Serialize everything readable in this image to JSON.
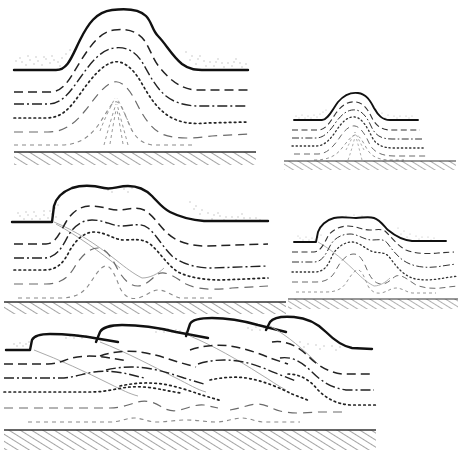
{
  "figure": {
    "background_color": "#ffffff",
    "width": 459,
    "height": 461,
    "ink_color": "#1a1a1a",
    "fault_color": "#9a9a9a",
    "stipple_color": "#bdbdbd"
  },
  "legend_styles": {
    "topographic_surface": "heavy solid black line",
    "horizon_1": "long dash",
    "horizon_2": "dash-dot",
    "horizon_3": "fine dotted",
    "horizon_4": "long dash light",
    "horizon_5": "fine dash light",
    "basement_top": "solid rule with dense diagonal hatching below",
    "fault_trace": "thin grey line",
    "surface_cover": "stipple"
  },
  "panels": [
    {
      "id": "panel-a",
      "name": "large-detachment-fold",
      "scale": "large",
      "stage": "1",
      "description": "Symmetric detachment anticline with flat crest, no surface breaking fault",
      "x": 8,
      "y": 2,
      "width": 248,
      "height": 164,
      "horizon_count": 6,
      "fault_count": 0,
      "basement_depth": 152
    },
    {
      "id": "panel-b",
      "name": "small-detachment-fold",
      "scale": "small",
      "stage": "1",
      "description": "Reduced-scale symmetric detachment anticline, same geometry as panel A",
      "x": 288,
      "y": 92,
      "width": 168,
      "height": 74,
      "horizon_count": 6,
      "fault_count": 0,
      "basement_depth": 146
    },
    {
      "id": "panel-c",
      "name": "large-thrusted-fold",
      "scale": "large",
      "stage": "2",
      "description": "Breached anticline, forelimb thrust ramp cuts to surface producing a scarp on the left flank",
      "x": 8,
      "y": 182,
      "width": 262,
      "height": 124,
      "horizon_count": 6,
      "fault_count": 1,
      "basement_depth": 296
    },
    {
      "id": "panel-d",
      "name": "small-thrusted-fold",
      "scale": "small",
      "stage": "2",
      "description": "Reduced-scale breached anticline with forelimb thrust, same geometry as panel C",
      "x": 292,
      "y": 206,
      "width": 164,
      "height": 98,
      "horizon_count": 6,
      "fault_count": 1,
      "basement_depth": 298
    },
    {
      "id": "panel-e",
      "name": "imbricate-thrust-stack",
      "scale": "large",
      "stage": "3",
      "description": "Four stacked imbricate thrust sheets climbing to the right, each with its own hanging-wall anticline",
      "x": 4,
      "y": 316,
      "width": 368,
      "height": 136,
      "horizon_count": 6,
      "fault_count": 4,
      "thrust_sheet_count": 4,
      "basement_depth": 430
    }
  ]
}
